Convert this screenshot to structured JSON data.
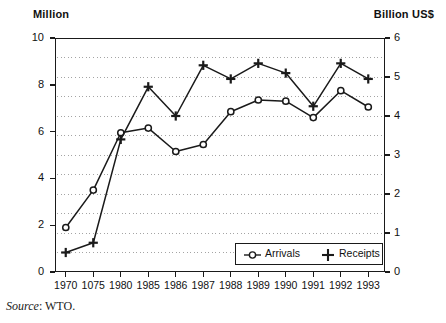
{
  "header": {
    "left_axis_unit": "Million",
    "right_axis_unit": "Billion US$"
  },
  "legend": {
    "arrivals_label": "Arrivals",
    "receipts_label": "Receipts",
    "arrivals_marker": "open-circle-marker",
    "receipts_marker": "plus-marker",
    "position": "inside-bottom-right"
  },
  "source": {
    "prefix": "Source",
    "separator": ":",
    "value": "WTO."
  },
  "colors": {
    "line": "#1a1a1a",
    "axis": "#1a1a1a",
    "grid": "#9a9a9a",
    "background": "#ffffff"
  },
  "chart_data": {
    "type": "line",
    "title": "",
    "xlabel": "",
    "ylabel": "Million",
    "y2label": "Billion US$",
    "grid": true,
    "legend_position": "inside-bottom-right",
    "categories": [
      "1970",
      "1075",
      "1980",
      "1985",
      "1986",
      "1987",
      "1988",
      "1989",
      "1990",
      "1991",
      "1992",
      "1993"
    ],
    "x": [
      "1970",
      "1075",
      "1980",
      "1985",
      "1986",
      "1987",
      "1988",
      "1989",
      "1990",
      "1991",
      "1992",
      "1993"
    ],
    "ylim": [
      0,
      10
    ],
    "y2lim": [
      0,
      6
    ],
    "yticks": [
      0,
      2,
      4,
      6,
      8,
      10
    ],
    "y2ticks": [
      0,
      1,
      2,
      3,
      4,
      5,
      6
    ],
    "series": [
      {
        "name": "Arrivals",
        "axis": "left",
        "unit": "Million",
        "marker": "open-circle",
        "values": [
          1.9,
          3.5,
          5.95,
          6.15,
          5.15,
          5.45,
          6.85,
          7.35,
          7.3,
          6.6,
          7.75,
          7.05
        ]
      },
      {
        "name": "Receipts",
        "axis": "right",
        "unit": "Billion US$",
        "marker": "plus",
        "values": [
          0.5,
          0.75,
          3.4,
          4.75,
          4.0,
          5.3,
          4.95,
          5.35,
          5.1,
          4.25,
          5.35,
          4.95
        ]
      }
    ]
  }
}
